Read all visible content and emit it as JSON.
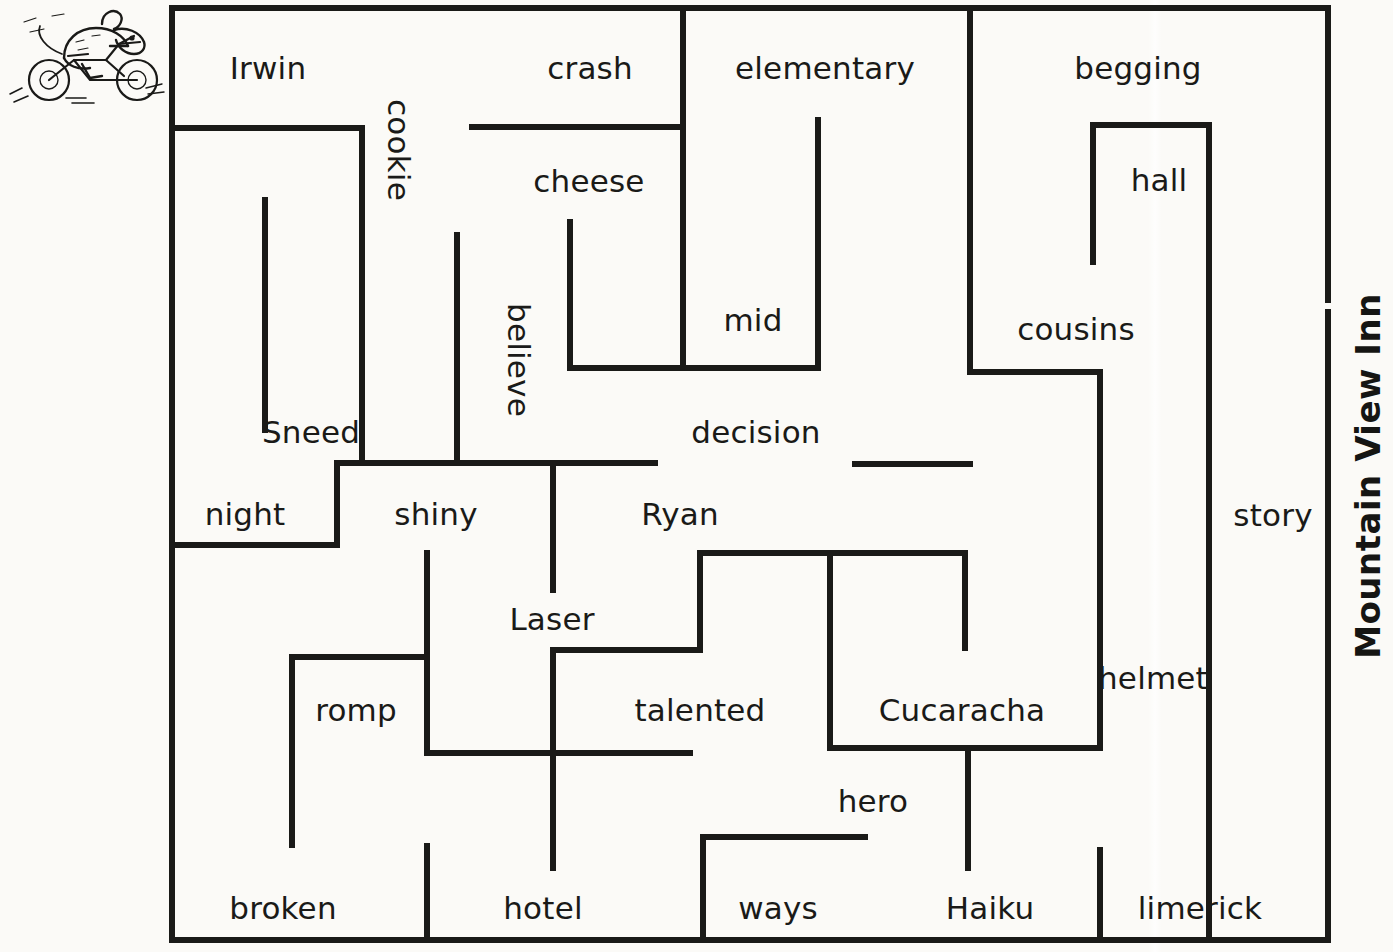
{
  "page": {
    "side_title": "Mountain View Inn",
    "logo_alt": "mouse-on-motorcycle-logo"
  },
  "maze": {
    "wall_color": "#1a1a18",
    "background_color": "#fbfaf7",
    "labels": [
      {
        "text": "Irwin",
        "x": 268,
        "y": 68,
        "vertical": false
      },
      {
        "text": "crash",
        "x": 590,
        "y": 68,
        "vertical": false
      },
      {
        "text": "elementary",
        "x": 825,
        "y": 68,
        "vertical": false
      },
      {
        "text": "begging",
        "x": 1138,
        "y": 68,
        "vertical": false
      },
      {
        "text": "cookie",
        "x": 398,
        "y": 150,
        "vertical": true
      },
      {
        "text": "cheese",
        "x": 589,
        "y": 181,
        "vertical": false
      },
      {
        "text": "hall",
        "x": 1159,
        "y": 180,
        "vertical": false
      },
      {
        "text": "mid",
        "x": 753,
        "y": 320,
        "vertical": false
      },
      {
        "text": "cousins",
        "x": 1076,
        "y": 329,
        "vertical": false
      },
      {
        "text": "believe",
        "x": 518,
        "y": 360,
        "vertical": true
      },
      {
        "text": "Sneed",
        "x": 311,
        "y": 432,
        "vertical": false
      },
      {
        "text": "decision",
        "x": 756,
        "y": 432,
        "vertical": false
      },
      {
        "text": "night",
        "x": 245,
        "y": 514,
        "vertical": false
      },
      {
        "text": "shiny",
        "x": 436,
        "y": 514,
        "vertical": false
      },
      {
        "text": "Ryan",
        "x": 680,
        "y": 514,
        "vertical": false
      },
      {
        "text": "story",
        "x": 1273,
        "y": 515,
        "vertical": false
      },
      {
        "text": "Laser",
        "x": 552,
        "y": 619,
        "vertical": false
      },
      {
        "text": "helmet",
        "x": 1153,
        "y": 678,
        "vertical": false
      },
      {
        "text": "romp",
        "x": 356,
        "y": 710,
        "vertical": false
      },
      {
        "text": "talented",
        "x": 700,
        "y": 710,
        "vertical": false
      },
      {
        "text": "Cucaracha",
        "x": 962,
        "y": 710,
        "vertical": false
      },
      {
        "text": "hero",
        "x": 873,
        "y": 801,
        "vertical": false
      },
      {
        "text": "broken",
        "x": 283,
        "y": 908,
        "vertical": false
      },
      {
        "text": "hotel",
        "x": 543,
        "y": 908,
        "vertical": false
      },
      {
        "text": "ways",
        "x": 778,
        "y": 908,
        "vertical": false
      },
      {
        "text": "Haiku",
        "x": 990,
        "y": 908,
        "vertical": false
      },
      {
        "text": "limerick",
        "x": 1200,
        "y": 908,
        "vertical": false
      }
    ],
    "walls": [
      {
        "name": "outer-top",
        "x1": 172,
        "y1": 8,
        "x2": 1328,
        "y2": 8
      },
      {
        "name": "outer-left",
        "x1": 172,
        "y1": 8,
        "x2": 172,
        "y2": 940
      },
      {
        "name": "outer-bottom",
        "x1": 172,
        "y1": 940,
        "x2": 1328,
        "y2": 940
      },
      {
        "name": "outer-right-upper",
        "x1": 1328,
        "y1": 8,
        "x2": 1328,
        "y2": 300
      },
      {
        "name": "outer-right-lower",
        "x1": 1328,
        "y1": 312,
        "x2": 1328,
        "y2": 940
      },
      {
        "name": "irwin-room-top",
        "x1": 172,
        "y1": 128,
        "x2": 362,
        "y2": 128
      },
      {
        "name": "irwin-room-right",
        "x1": 362,
        "y1": 128,
        "x2": 362,
        "y2": 463
      },
      {
        "name": "irwin-room-bottom",
        "x1": 337,
        "y1": 463,
        "x2": 655,
        "y2": 463
      },
      {
        "name": "cookie-stub",
        "x1": 265,
        "y1": 200,
        "x2": 265,
        "y2": 430
      },
      {
        "name": "crash-cross-wall",
        "x1": 472,
        "y1": 127,
        "x2": 683,
        "y2": 127
      },
      {
        "name": "elementary-left",
        "x1": 683,
        "y1": 8,
        "x2": 683,
        "y2": 368
      },
      {
        "name": "cheese-left",
        "x1": 570,
        "y1": 222,
        "x2": 570,
        "y2": 368
      },
      {
        "name": "cheese-bottom",
        "x1": 570,
        "y1": 368,
        "x2": 818,
        "y2": 368
      },
      {
        "name": "mid-right",
        "x1": 818,
        "y1": 120,
        "x2": 818,
        "y2": 368
      },
      {
        "name": "believe-stub",
        "x1": 457,
        "y1": 235,
        "x2": 457,
        "y2": 463
      },
      {
        "name": "night-right",
        "x1": 337,
        "y1": 463,
        "x2": 337,
        "y2": 545
      },
      {
        "name": "night-bottom",
        "x1": 172,
        "y1": 545,
        "x2": 337,
        "y2": 545
      },
      {
        "name": "begging-left",
        "x1": 970,
        "y1": 8,
        "x2": 970,
        "y2": 372
      },
      {
        "name": "hall-left",
        "x1": 1093,
        "y1": 125,
        "x2": 1093,
        "y2": 262
      },
      {
        "name": "hall-top",
        "x1": 1093,
        "y1": 125,
        "x2": 1209,
        "y2": 125
      },
      {
        "name": "hall-right",
        "x1": 1209,
        "y1": 125,
        "x2": 1209,
        "y2": 940
      },
      {
        "name": "cousins-bottom",
        "x1": 970,
        "y1": 372,
        "x2": 1100,
        "y2": 372
      },
      {
        "name": "cousins-right",
        "x1": 1100,
        "y1": 372,
        "x2": 1100,
        "y2": 748
      },
      {
        "name": "decision-bottom",
        "x1": 855,
        "y1": 464,
        "x2": 970,
        "y2": 464
      },
      {
        "name": "laser-stub",
        "x1": 553,
        "y1": 463,
        "x2": 553,
        "y2": 590
      },
      {
        "name": "shiny-stub",
        "x1": 427,
        "y1": 553,
        "x2": 427,
        "y2": 753
      },
      {
        "name": "ryan-bottom-left",
        "x1": 700,
        "y1": 553,
        "x2": 965,
        "y2": 553
      },
      {
        "name": "ryan-step-left",
        "x1": 700,
        "y1": 553,
        "x2": 700,
        "y2": 650
      },
      {
        "name": "talented-top",
        "x1": 553,
        "y1": 650,
        "x2": 700,
        "y2": 650
      },
      {
        "name": "cucaracha-left",
        "x1": 830,
        "y1": 553,
        "x2": 830,
        "y2": 748
      },
      {
        "name": "cucaracha-rt-stub",
        "x1": 965,
        "y1": 553,
        "x2": 965,
        "y2": 648
      },
      {
        "name": "cucaracha-bottom",
        "x1": 830,
        "y1": 748,
        "x2": 1100,
        "y2": 748
      },
      {
        "name": "romp-top",
        "x1": 292,
        "y1": 657,
        "x2": 427,
        "y2": 657
      },
      {
        "name": "romp-left",
        "x1": 292,
        "y1": 657,
        "x2": 292,
        "y2": 845
      },
      {
        "name": "talented-bottom",
        "x1": 427,
        "y1": 753,
        "x2": 690,
        "y2": 753
      },
      {
        "name": "hotel-stub",
        "x1": 553,
        "y1": 650,
        "x2": 553,
        "y2": 868
      },
      {
        "name": "broken-right",
        "x1": 427,
        "y1": 846,
        "x2": 427,
        "y2": 940
      },
      {
        "name": "ways-top",
        "x1": 703,
        "y1": 837,
        "x2": 865,
        "y2": 837
      },
      {
        "name": "ways-left",
        "x1": 703,
        "y1": 837,
        "x2": 703,
        "y2": 940
      },
      {
        "name": "haiku-stub",
        "x1": 968,
        "y1": 748,
        "x2": 968,
        "y2": 868
      },
      {
        "name": "limerick-left",
        "x1": 1100,
        "y1": 850,
        "x2": 1100,
        "y2": 940
      }
    ]
  }
}
